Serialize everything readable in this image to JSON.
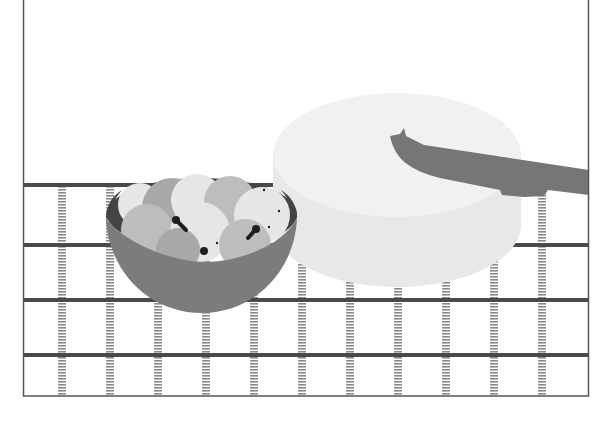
{
  "scene": {
    "description": "Grayscale flat illustration of a bowl of fruit and a large round cheese wheel with a knife on a checked tablecloth",
    "colors": {
      "background": "#ffffff",
      "frame": "#555555",
      "band": "#4a4a4a",
      "stripe": "#8a8a8a",
      "bowl_outer": "#7c7c7c",
      "bowl_rim": "#444444",
      "fruit_light": "#e6e6e6",
      "fruit_mid": "#bdbdbd",
      "fruit_dark": "#a8a8a8",
      "stem": "#1e1e1e",
      "cheese_top": "#f1f1f1",
      "cheese_side": "#e8e8e8",
      "knife": "#767676"
    },
    "frame": {
      "x": 23,
      "y": 0,
      "width": 566,
      "height": 396
    },
    "tablecloth": {
      "horizontal_bands_y": [
        185,
        245,
        300,
        355
      ],
      "vertical_stripes_x": [
        62,
        110,
        158,
        206,
        254,
        302,
        350,
        398,
        446,
        494,
        542
      ]
    },
    "objects": [
      {
        "name": "fruit-bowl",
        "label": "Bowl of fruit"
      },
      {
        "name": "cheese-wheel",
        "label": "Cheese wheel"
      },
      {
        "name": "knife",
        "label": "Knife"
      }
    ]
  }
}
